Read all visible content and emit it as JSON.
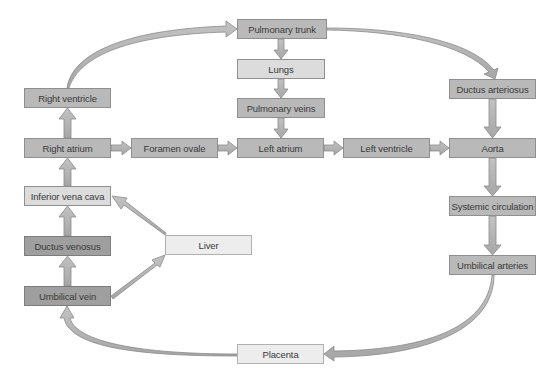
{
  "diagram": {
    "type": "fetal-circulation-flowchart",
    "colors": {
      "medium": "#b9b9b9",
      "light": "#dcdcdc",
      "pale": "#ededed",
      "dark": "#9f9f9f",
      "arrow_fill": "#b3b3b3",
      "arrow_stroke": "#8a8a8a"
    },
    "nodes": {
      "pulmonary_trunk": "Pulmonary trunk",
      "lungs": "Lungs",
      "pulmonary_veins": "Pulmonary veins",
      "right_ventricle": "Right ventricle",
      "right_atrium": "Right atrium",
      "foramen_ovale": "Foramen ovale",
      "left_atrium": "Left atrium",
      "left_ventricle": "Left ventricle",
      "aorta": "Aorta",
      "ductus_arteriosus": "Ductus arteriosus",
      "inferior_vena_cava": "Inferior vena cava",
      "ductus_venosus": "Ductus venosus",
      "umbilical_vein": "Umbilical vein",
      "liver": "Liver",
      "systemic_circulation": "Systemic circulation",
      "umbilical_arteries": "Umbilical arteries",
      "placenta": "Placenta"
    },
    "edges": [
      [
        "Right ventricle",
        "Pulmonary trunk"
      ],
      [
        "Pulmonary trunk",
        "Lungs"
      ],
      [
        "Lungs",
        "Pulmonary veins"
      ],
      [
        "Pulmonary veins",
        "Left atrium"
      ],
      [
        "Pulmonary trunk",
        "Ductus arteriosus"
      ],
      [
        "Ductus arteriosus",
        "Aorta"
      ],
      [
        "Right atrium",
        "Right ventricle"
      ],
      [
        "Right atrium",
        "Foramen ovale"
      ],
      [
        "Foramen ovale",
        "Left atrium"
      ],
      [
        "Left atrium",
        "Left ventricle"
      ],
      [
        "Left ventricle",
        "Aorta"
      ],
      [
        "Aorta",
        "Systemic circulation"
      ],
      [
        "Systemic circulation",
        "Umbilical arteries"
      ],
      [
        "Umbilical arteries",
        "Placenta"
      ],
      [
        "Placenta",
        "Umbilical vein"
      ],
      [
        "Umbilical vein",
        "Ductus venosus"
      ],
      [
        "Umbilical vein",
        "Liver"
      ],
      [
        "Ductus venosus",
        "Inferior vena cava"
      ],
      [
        "Liver",
        "Inferior vena cava"
      ],
      [
        "Inferior vena cava",
        "Right atrium"
      ]
    ]
  }
}
